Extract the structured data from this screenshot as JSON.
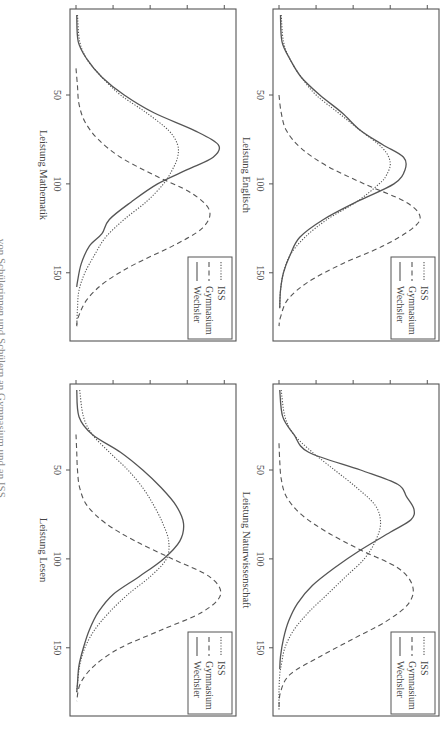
{
  "page": {
    "header_partial": "… von Schülerinnen und Schülern an Gymnasium und an ISS"
  },
  "legend": {
    "entries": [
      {
        "label": "ISS",
        "style": "dotted"
      },
      {
        "label": "Gymnasium",
        "style": "dashed"
      },
      {
        "label": "Wechsler",
        "style": "solid"
      }
    ]
  },
  "colors": {
    "line": "#555555",
    "axis": "#555555",
    "text": "#444444"
  },
  "chart_data": [
    {
      "type": "line",
      "panel": "top-left",
      "xlabel": "Leistung Mathematik",
      "ylabel": "Dichte",
      "x_ticks": [
        50,
        100,
        150
      ],
      "y_ticks": [
        "0.000",
        "0.005",
        "0.010",
        "0.015",
        "0.020"
      ],
      "xlim": [
        5,
        185
      ],
      "ylim": [
        0,
        0.0205
      ],
      "series": [
        {
          "name": "ISS",
          "style": "dotted",
          "x": [
            5,
            20,
            30,
            40,
            50,
            60,
            70,
            78,
            85,
            92,
            100,
            110,
            120,
            130,
            140,
            150,
            160,
            170,
            180
          ],
          "y": [
            0.0002,
            0.0005,
            0.0015,
            0.0035,
            0.006,
            0.0095,
            0.0125,
            0.0137,
            0.0137,
            0.013,
            0.0118,
            0.0095,
            0.0065,
            0.004,
            0.0025,
            0.0012,
            0.0004,
            0.0002,
            0.0001
          ]
        },
        {
          "name": "Gymnasium",
          "style": "dashed",
          "x": [
            35,
            45,
            55,
            65,
            75,
            85,
            95,
            105,
            115,
            125,
            135,
            145,
            155,
            165,
            175,
            180
          ],
          "y": [
            0.0,
            0.0002,
            0.0004,
            0.0012,
            0.003,
            0.006,
            0.0105,
            0.0155,
            0.018,
            0.017,
            0.013,
            0.008,
            0.004,
            0.0015,
            0.0003,
            0.0001
          ]
        },
        {
          "name": "Wechsler",
          "style": "solid",
          "x": [
            5,
            20,
            30,
            40,
            50,
            60,
            70,
            78,
            85,
            92,
            100,
            110,
            120,
            128,
            135,
            145,
            155,
            158
          ],
          "y": [
            0.0001,
            0.0003,
            0.0015,
            0.0035,
            0.0065,
            0.0105,
            0.016,
            0.0192,
            0.0185,
            0.015,
            0.011,
            0.0075,
            0.0045,
            0.0035,
            0.0018,
            0.0007,
            0.0002,
            0.0001
          ]
        }
      ]
    },
    {
      "type": "line",
      "panel": "top-right",
      "xlabel": "Leistung Englisch",
      "ylabel": "Dichte",
      "x_ticks": [
        50,
        100,
        150
      ],
      "y_ticks": [
        "0.000",
        "0.005",
        "0.010",
        "0.015",
        "0.020"
      ],
      "xlim": [
        5,
        185
      ],
      "ylim": [
        0,
        0.0205
      ],
      "series": [
        {
          "name": "ISS",
          "style": "dotted",
          "x": [
            5,
            20,
            30,
            40,
            50,
            60,
            70,
            80,
            88,
            95,
            100,
            110,
            120,
            130,
            140,
            150,
            160,
            170
          ],
          "y": [
            0.0003,
            0.0006,
            0.0015,
            0.003,
            0.005,
            0.008,
            0.011,
            0.014,
            0.015,
            0.0145,
            0.0135,
            0.0105,
            0.0065,
            0.0035,
            0.0015,
            0.0006,
            0.0002,
            0.0001
          ]
        },
        {
          "name": "Gymnasium",
          "style": "dashed",
          "x": [
            50,
            60,
            70,
            80,
            90,
            100,
            110,
            118,
            125,
            135,
            145,
            155,
            165,
            175,
            180
          ],
          "y": [
            0.0,
            0.0003,
            0.001,
            0.003,
            0.0065,
            0.0115,
            0.017,
            0.019,
            0.018,
            0.014,
            0.0085,
            0.004,
            0.0012,
            0.0002,
            0.0
          ]
        },
        {
          "name": "Wechsler",
          "style": "solid",
          "x": [
            5,
            20,
            30,
            40,
            50,
            60,
            70,
            78,
            85,
            92,
            100,
            110,
            120,
            130,
            140,
            150,
            160,
            170
          ],
          "y": [
            0.0002,
            0.0004,
            0.0015,
            0.003,
            0.0055,
            0.0085,
            0.011,
            0.014,
            0.0168,
            0.017,
            0.0155,
            0.0105,
            0.006,
            0.0028,
            0.0015,
            0.0006,
            0.0002,
            0.0001
          ]
        }
      ]
    },
    {
      "type": "line",
      "panel": "bottom-left",
      "xlabel": "Leistung Lesen",
      "ylabel": "Dichte",
      "x_ticks": [
        50,
        100,
        150
      ],
      "y_ticks": [
        "0.000",
        "0.005",
        "0.010",
        "0.015",
        "0.020"
      ],
      "xlim": [
        5,
        185
      ],
      "ylim": [
        0,
        0.0205
      ],
      "series": [
        {
          "name": "ISS",
          "style": "dotted",
          "x": [
            5,
            20,
            30,
            40,
            50,
            60,
            70,
            80,
            90,
            100,
            110,
            120,
            130,
            140,
            150,
            160,
            170,
            175
          ],
          "y": [
            0.0005,
            0.001,
            0.0022,
            0.0045,
            0.007,
            0.009,
            0.0105,
            0.0117,
            0.0125,
            0.0122,
            0.01,
            0.007,
            0.0045,
            0.0025,
            0.0012,
            0.0005,
            0.0002,
            0.0001
          ]
        },
        {
          "name": "Gymnasium",
          "style": "dashed",
          "x": [
            30,
            40,
            50,
            60,
            70,
            80,
            90,
            100,
            110,
            120,
            130,
            140,
            150,
            160,
            170,
            180
          ],
          "y": [
            0.0,
            0.0001,
            0.0002,
            0.0005,
            0.0015,
            0.004,
            0.008,
            0.013,
            0.018,
            0.0195,
            0.017,
            0.0115,
            0.006,
            0.0025,
            0.0006,
            0.0001
          ]
        },
        {
          "name": "Wechsler",
          "style": "solid",
          "x": [
            5,
            20,
            30,
            40,
            50,
            60,
            70,
            80,
            90,
            100,
            110,
            120,
            130,
            140,
            150,
            160,
            170,
            175
          ],
          "y": [
            0.0001,
            0.0004,
            0.0022,
            0.006,
            0.009,
            0.0115,
            0.0135,
            0.0145,
            0.014,
            0.0118,
            0.0085,
            0.005,
            0.003,
            0.0018,
            0.001,
            0.0004,
            0.0002,
            0.0001
          ]
        }
      ]
    },
    {
      "type": "line",
      "panel": "bottom-right",
      "xlabel": "Leistung Naturwissenschaft",
      "ylabel": "Dichte",
      "x_ticks": [
        50,
        100,
        150
      ],
      "y_ticks": [
        "0.000",
        "0.005",
        "0.010",
        "0.015",
        "0.020"
      ],
      "xlim": [
        5,
        185
      ],
      "ylim": [
        0,
        0.0205
      ],
      "series": [
        {
          "name": "ISS",
          "style": "dotted",
          "x": [
            5,
            20,
            30,
            40,
            50,
            60,
            70,
            80,
            90,
            100,
            110,
            120,
            130,
            140,
            150,
            160,
            165,
            175,
            185
          ],
          "y": [
            0.0003,
            0.0008,
            0.002,
            0.0045,
            0.0075,
            0.0105,
            0.013,
            0.0137,
            0.013,
            0.0115,
            0.009,
            0.0065,
            0.004,
            0.002,
            0.0008,
            0.0003,
            0.0001,
            0.0,
            0.0
          ]
        },
        {
          "name": "Gymnasium",
          "style": "dashed",
          "x": [
            35,
            45,
            55,
            65,
            75,
            85,
            95,
            105,
            115,
            125,
            135,
            145,
            155,
            165,
            175,
            185
          ],
          "y": [
            0.0,
            0.0001,
            0.0003,
            0.001,
            0.003,
            0.0065,
            0.011,
            0.016,
            0.018,
            0.0175,
            0.0145,
            0.01,
            0.0055,
            0.0015,
            0.0002,
            0.0
          ]
        },
        {
          "name": "Wechsler",
          "style": "solid",
          "x": [
            5,
            20,
            30,
            40,
            50,
            58,
            65,
            72,
            78,
            85,
            95,
            105,
            115,
            125,
            135,
            145,
            155,
            162
          ],
          "y": [
            0.0001,
            0.0005,
            0.002,
            0.004,
            0.011,
            0.016,
            0.0172,
            0.0182,
            0.0178,
            0.015,
            0.011,
            0.0075,
            0.0045,
            0.0025,
            0.0013,
            0.0006,
            0.0002,
            0.0001
          ]
        }
      ]
    }
  ]
}
